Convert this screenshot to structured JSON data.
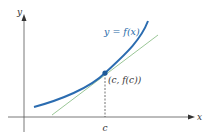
{
  "diagram": {
    "axes": {
      "x_label": "x",
      "y_label": "y"
    },
    "curve_label": "y = f(x)",
    "point_label": "(c, f(c))",
    "tick_label": "c",
    "colors": {
      "curve": "#2b6cb0",
      "tangent": "#8fbf8a",
      "axis": "#555555",
      "point": "#1f5a99"
    }
  }
}
